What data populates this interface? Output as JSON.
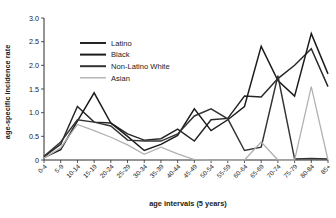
{
  "chart_data": {
    "type": "line",
    "title": "",
    "xlabel": "age intervals (5 years)",
    "ylabel": "age-specific incidence rate",
    "categories": [
      "0-4",
      "5-9",
      "10-14",
      "15-19",
      "20-24",
      "25-29",
      "30-34",
      "35-39",
      "40-44",
      "45-49",
      "50-54",
      "55-59",
      "60-64",
      "65-69",
      "70-74",
      "75-79",
      "80-84",
      "85+"
    ],
    "ylim": [
      0,
      3.0
    ],
    "yticks": [
      "0",
      "0.5",
      "1.0",
      "1.5",
      "2.0",
      "2.5",
      "3.0"
    ],
    "ytick_values": [
      0,
      0.5,
      1.0,
      1.5,
      2.0,
      2.5,
      3.0
    ],
    "grid": false,
    "legend_position": "top-left-inside",
    "series": [
      {
        "name": "Latino",
        "color": "#262626",
        "values": [
          0.07,
          0.33,
          1.13,
          0.8,
          0.78,
          0.55,
          0.42,
          0.45,
          0.65,
          0.4,
          0.85,
          0.88,
          1.35,
          1.33,
          1.72,
          2.0,
          2.35,
          1.55
        ]
      },
      {
        "name": "Black",
        "color": "#1a1a1a",
        "values": [
          0.05,
          0.22,
          0.82,
          1.42,
          0.78,
          0.5,
          0.2,
          0.33,
          0.52,
          1.08,
          0.62,
          0.85,
          1.13,
          2.4,
          1.68,
          1.35,
          2.67,
          1.82
        ]
      },
      {
        "name": "Non-Latino White",
        "color": "#333333",
        "values": [
          0.08,
          0.38,
          0.85,
          0.8,
          0.72,
          0.42,
          0.4,
          0.4,
          0.55,
          0.93,
          1.08,
          0.87,
          0.2,
          0.27,
          1.78,
          0.02,
          0.03,
          0.02
        ]
      },
      {
        "name": "Asian",
        "color": "#b0b0b0",
        "values": [
          0.04,
          0.26,
          0.75,
          0.62,
          0.48,
          0.32,
          0.12,
          0.27,
          0.13,
          0.01,
          0.0,
          0.0,
          0.0,
          0.38,
          0.0,
          0.0,
          1.55,
          0.0
        ]
      }
    ],
    "legend": [
      {
        "label": "Latino",
        "color": "#262626"
      },
      {
        "label": "Black",
        "color": "#1a1a1a"
      },
      {
        "label": "Non-Latino White",
        "color": "#333333"
      },
      {
        "label": "Asian",
        "color": "#b0b0b0"
      }
    ]
  }
}
